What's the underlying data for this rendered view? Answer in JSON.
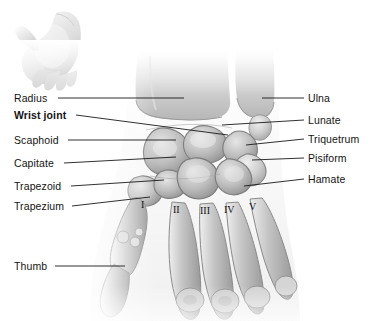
{
  "figure": {
    "background_color": "#ffffff",
    "text_color": "#141414",
    "leader_color": "#1a1a1a"
  },
  "inset": {
    "name": "hand-orientation-inset",
    "description": "Small grayscale drawing of an open hand indicating orientation"
  },
  "labels_left": [
    {
      "text": "Radius",
      "bold": false,
      "x": 14,
      "y": 93,
      "line_from_x": 58,
      "line_to_x": 184,
      "line_from_y": 98,
      "line_to_y": 98
    },
    {
      "text": "Wrist joint",
      "bold": true,
      "x": 14,
      "y": 110,
      "line_from_x": 76,
      "line_to_x": 228,
      "line_from_y": 115,
      "line_to_y": 135
    },
    {
      "text": "Scaphoid",
      "bold": false,
      "x": 14,
      "y": 135,
      "line_from_x": 68,
      "line_to_x": 176,
      "line_from_y": 140,
      "line_to_y": 140
    },
    {
      "text": "Capitate",
      "bold": false,
      "x": 14,
      "y": 158,
      "line_from_x": 64,
      "line_to_x": 176,
      "line_from_y": 163,
      "line_to_y": 157
    },
    {
      "text": "Trapezoid",
      "bold": false,
      "x": 14,
      "y": 181,
      "line_from_x": 71,
      "line_to_x": 164,
      "line_from_y": 186,
      "line_to_y": 180
    },
    {
      "text": "Trapezium",
      "bold": false,
      "x": 14,
      "y": 201,
      "line_from_x": 72,
      "line_to_x": 150,
      "line_from_y": 206,
      "line_to_y": 197
    },
    {
      "text": "Thumb",
      "bold": false,
      "x": 14,
      "y": 261,
      "line_from_x": 55,
      "line_to_x": 125,
      "line_from_y": 266,
      "line_to_y": 266
    }
  ],
  "labels_right": [
    {
      "text": "Ulna",
      "x": 308,
      "y": 93,
      "line_from_x": 262,
      "line_to_x": 304,
      "line_from_y": 98,
      "line_to_y": 98
    },
    {
      "text": "Lunate",
      "x": 308,
      "y": 115,
      "line_from_x": 222,
      "line_to_x": 304,
      "line_from_y": 125,
      "line_to_y": 120
    },
    {
      "text": "Triquetrum",
      "x": 308,
      "y": 134,
      "line_from_x": 246,
      "line_to_x": 304,
      "line_from_y": 145,
      "line_to_y": 139
    },
    {
      "text": "Pisiform",
      "x": 308,
      "y": 153,
      "line_from_x": 252,
      "line_to_x": 304,
      "line_from_y": 160,
      "line_to_y": 158
    },
    {
      "text": "Hamate",
      "x": 308,
      "y": 174,
      "line_from_x": 244,
      "line_to_x": 304,
      "line_from_y": 186,
      "line_to_y": 179
    }
  ],
  "metacarpal_numerals": [
    {
      "text": "I",
      "x": 141,
      "y": 199
    },
    {
      "text": "II",
      "x": 173,
      "y": 204
    },
    {
      "text": "III",
      "x": 200,
      "y": 205
    },
    {
      "text": "IV",
      "x": 224,
      "y": 204
    },
    {
      "text": "V",
      "x": 249,
      "y": 201
    }
  ]
}
